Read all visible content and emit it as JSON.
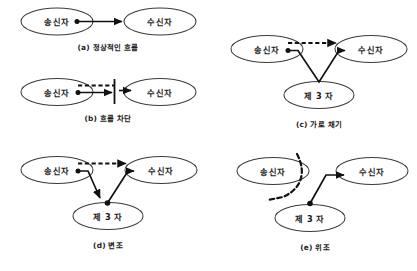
{
  "figure": {
    "node_labels": {
      "sender": "송신자",
      "receiver": "수신자",
      "third_party": "제 3 자"
    },
    "colors": {
      "line": "#111111",
      "ellipse_stroke": "#3b3b3b",
      "ellipse_fill": "#ffffff",
      "background": "#ffffff",
      "text": "#1a1a1a"
    },
    "panels": [
      {
        "id": "a",
        "caption": "(a) 정상적인 흐름",
        "nodes": [
          {
            "name": "sender",
            "label": "송신자"
          },
          {
            "name": "receiver",
            "label": "수신자"
          }
        ],
        "edges": [
          {
            "name": "normal-flow-arrow",
            "style": "solid",
            "from": "sender",
            "to": "receiver",
            "arrowhead": true,
            "origin_dot": true
          }
        ]
      },
      {
        "id": "b",
        "caption": "(b) 흐름 차단",
        "nodes": [
          {
            "name": "sender",
            "label": "송신자"
          },
          {
            "name": "receiver",
            "label": "수신자"
          }
        ],
        "edges": [
          {
            "name": "intended-flow-dashed",
            "style": "dashed",
            "from": "sender",
            "to": "receiver",
            "arrowhead": false,
            "origin_dot": false
          },
          {
            "name": "blocked-flow-arrow",
            "style": "solid",
            "from": "sender",
            "to": "barrier",
            "arrowhead": true,
            "origin_dot": true
          },
          {
            "name": "resumed-flow-arrow",
            "style": "solid",
            "from": "barrier",
            "to": "receiver",
            "arrowhead": true,
            "origin_dot": false
          }
        ],
        "marks": [
          {
            "name": "interruption-barrier",
            "type": "vertical-bar"
          }
        ]
      },
      {
        "id": "c",
        "caption": "(c) 가로 채기",
        "nodes": [
          {
            "name": "sender",
            "label": "송신자"
          },
          {
            "name": "receiver",
            "label": "수신자"
          },
          {
            "name": "third-party",
            "label": "제 3 자"
          }
        ],
        "edges": [
          {
            "name": "intended-flow-dashed",
            "style": "dashed",
            "from": "sender",
            "to": "receiver",
            "arrowhead": true,
            "origin_dot": false
          },
          {
            "name": "interception-path",
            "style": "solid",
            "from": "sender",
            "to": "receiver",
            "via": "third-party",
            "arrowhead": true,
            "origin_dot": true
          }
        ]
      },
      {
        "id": "d",
        "caption": "(d) 변조",
        "nodes": [
          {
            "name": "sender",
            "label": "송신자"
          },
          {
            "name": "receiver",
            "label": "수신자"
          },
          {
            "name": "third-party",
            "label": "제 3 자"
          }
        ],
        "edges": [
          {
            "name": "intended-flow-dashed",
            "style": "dashed",
            "from": "sender",
            "to": "receiver",
            "arrowhead": true,
            "origin_dot": false
          },
          {
            "name": "modification-inbound",
            "style": "solid",
            "from": "sender",
            "to": "third-party",
            "arrowhead": true,
            "origin_dot": true
          },
          {
            "name": "modification-outbound",
            "style": "solid",
            "from": "third-party",
            "to": "receiver",
            "arrowhead": true,
            "origin_dot": true
          }
        ]
      },
      {
        "id": "e",
        "caption": "(e) 위조",
        "nodes": [
          {
            "name": "sender",
            "label": "송신자"
          },
          {
            "name": "receiver",
            "label": "수신자"
          },
          {
            "name": "third-party",
            "label": "제 3 자"
          }
        ],
        "edges": [
          {
            "name": "blocked-sender-curve",
            "style": "dashed-curve",
            "from": "sender",
            "to": "none",
            "arrowhead": false,
            "origin_dot": false
          },
          {
            "name": "fabrication-arrow",
            "style": "solid",
            "from": "third-party",
            "to": "receiver",
            "arrowhead": true,
            "origin_dot": true
          }
        ]
      }
    ]
  }
}
